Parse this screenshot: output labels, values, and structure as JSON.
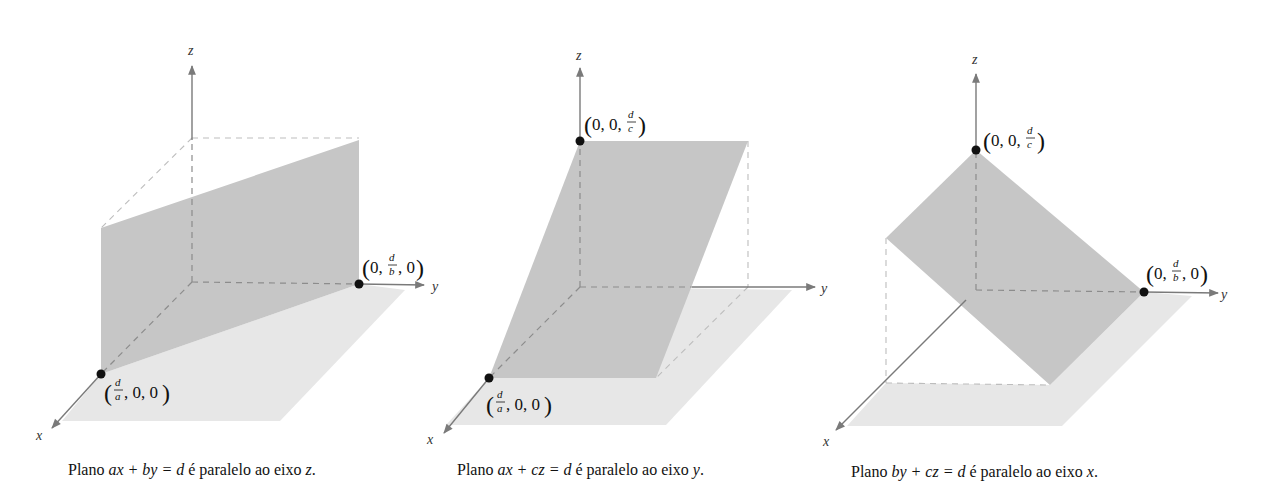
{
  "figure": {
    "panels": [
      {
        "id": "plane-parallel-z",
        "axes": {
          "x": "x",
          "y": "y",
          "z": "z"
        },
        "points": [
          {
            "label_prefix": "(",
            "frac_num": "d",
            "frac_den": "a",
            "rest": ", 0, 0)",
            "coords": "(d/a, 0, 0)"
          },
          {
            "label_prefix": "(0, ",
            "frac_num": "d",
            "frac_den": "b",
            "rest": ", 0)",
            "coords": "(0, d/b, 0)"
          }
        ],
        "caption": {
          "lead": "Plano ",
          "equation": "ax + by = d",
          "middle": " é paralelo ao eixo ",
          "axis": "z",
          "end": "."
        }
      },
      {
        "id": "plane-parallel-y",
        "axes": {
          "x": "x",
          "y": "y",
          "z": "z"
        },
        "points": [
          {
            "label_prefix": "(0, 0, ",
            "frac_num": "d",
            "frac_den": "c",
            "rest": ")",
            "coords": "(0, 0, d/c)"
          },
          {
            "label_prefix": "(",
            "frac_num": "d",
            "frac_den": "a",
            "rest": ", 0, 0)",
            "coords": "(d/a, 0, 0)"
          }
        ],
        "caption": {
          "lead": "Plano ",
          "equation": "ax + cz = d",
          "middle": " é paralelo ao eixo ",
          "axis": "y",
          "end": "."
        }
      },
      {
        "id": "plane-parallel-x",
        "axes": {
          "x": "x",
          "y": "y",
          "z": "z"
        },
        "points": [
          {
            "label_prefix": "(0, 0, ",
            "frac_num": "d",
            "frac_den": "c",
            "rest": ")",
            "coords": "(0, 0, d/c)"
          },
          {
            "label_prefix": "(0, ",
            "frac_num": "d",
            "frac_den": "b",
            "rest": ", 0)",
            "coords": "(0, d/b, 0)"
          }
        ],
        "caption": {
          "lead": "Plano ",
          "equation": "by + cz = d",
          "middle": " é paralelo ao eixo ",
          "axis": "x",
          "end": "."
        }
      }
    ],
    "colors": {
      "plane": "#c6c6c6",
      "floor": "#e7e7e7",
      "axis": "#7a7a7a",
      "point": "#111111"
    }
  }
}
